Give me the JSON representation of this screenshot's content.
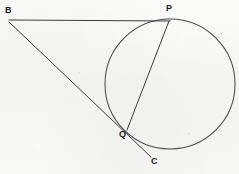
{
  "figure": {
    "background_color": "#f7f7f6",
    "stroke_color": "#3b3b3f",
    "label_color": "#1d1d20",
    "canvas": {
      "width": 239,
      "height": 174
    },
    "circle": {
      "name": "circle",
      "center_x": 170,
      "center_y": 84,
      "radius": 65
    },
    "points": [
      {
        "id": "B",
        "label": "B",
        "x": 9,
        "y": 20,
        "label_x": 5,
        "label_y": 6,
        "role": "external-point"
      },
      {
        "id": "P",
        "label": "P",
        "x": 169,
        "y": 21,
        "label_x": 166,
        "label_y": 4,
        "role": "tangent-point"
      },
      {
        "id": "Q",
        "label": "Q",
        "x": 128,
        "y": 129,
        "label_x": 119,
        "label_y": 130,
        "role": "secant-intersection"
      },
      {
        "id": "C",
        "label": "C",
        "x": 152,
        "y": 157,
        "label_x": 151,
        "label_y": 157,
        "role": "ray-endpoint"
      }
    ],
    "segments": [
      {
        "id": "BP",
        "label": "BP",
        "from": "B",
        "to": "P",
        "x1": 9,
        "y1": 20,
        "x2": 170,
        "y2": 21,
        "kind": "tangent"
      },
      {
        "id": "BC",
        "label": "BC",
        "from": "B",
        "to": "C",
        "x1": 9,
        "y1": 22,
        "x2": 151,
        "y2": 157,
        "kind": "secant"
      },
      {
        "id": "PQ",
        "label": "PQ",
        "from": "P",
        "to": "Q",
        "x1": 169,
        "y1": 21,
        "x2": 127,
        "y2": 130,
        "kind": "chord"
      }
    ]
  }
}
